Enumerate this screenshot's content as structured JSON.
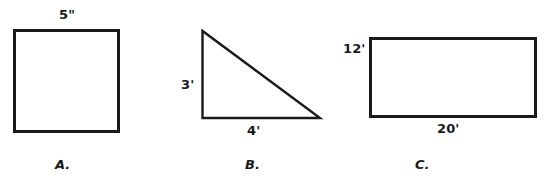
{
  "sheet": {
    "background_color": "#ffffff",
    "stroke_color": "#1a1a1a",
    "text_color": "#1a1a1a",
    "width": 550,
    "height": 185
  },
  "figures": [
    {
      "letter": "A.",
      "shape": "square",
      "shape_icon": "square-shape",
      "dimensions": [
        {
          "value": "5\"",
          "unit": "inches",
          "side": "top"
        }
      ],
      "geometry": {
        "x": 14,
        "y": 30,
        "width": 104,
        "height": 101
      }
    },
    {
      "letter": "B.",
      "shape": "right-triangle",
      "shape_icon": "right-triangle-shape",
      "dimensions": [
        {
          "value": "3'",
          "unit": "feet",
          "side": "left"
        },
        {
          "value": "4'",
          "unit": "feet",
          "side": "bottom"
        }
      ],
      "geometry": {
        "apex_x": 202,
        "apex_y": 31,
        "base_left_x": 202,
        "base_y": 118,
        "base_right_x": 320
      }
    },
    {
      "letter": "C.",
      "shape": "rectangle",
      "shape_icon": "rectangle-shape",
      "dimensions": [
        {
          "value": "12'",
          "unit": "feet",
          "side": "left"
        },
        {
          "value": "20'",
          "unit": "feet",
          "side": "bottom"
        }
      ],
      "geometry": {
        "x": 370,
        "y": 38,
        "width": 165,
        "height": 78
      }
    }
  ]
}
